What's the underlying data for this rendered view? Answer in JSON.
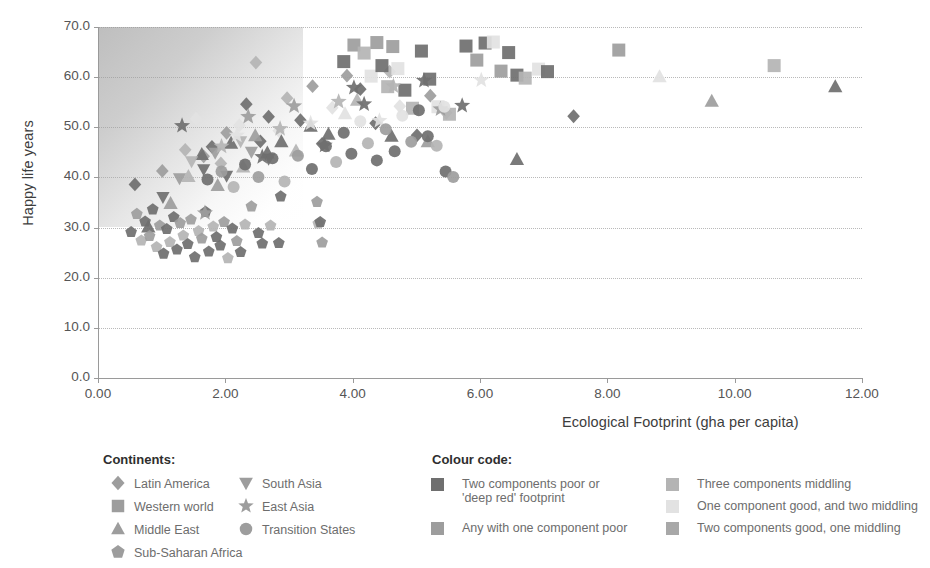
{
  "chart_data": {
    "type": "scatter",
    "title": "",
    "xlabel": "Ecological Footprint (gha per capita)",
    "ylabel": "Happy life years",
    "xlim": [
      0,
      12
    ],
    "ylim": [
      0,
      70
    ],
    "xticks": [
      "0.00",
      "2.00",
      "4.00",
      "6.00",
      "8.00",
      "10.00",
      "12.00"
    ],
    "yticks": [
      "0.0",
      "10.0",
      "20.0",
      "30.0",
      "40.0",
      "50.0",
      "60.0",
      "70.0"
    ],
    "xtick_values": [
      0,
      2,
      4,
      6,
      8,
      10,
      12
    ],
    "ytick_values": [
      0,
      10,
      20,
      30,
      40,
      50,
      60,
      70
    ],
    "grid": "horizontal-dotted",
    "legend_position": "below-plot",
    "shaded_region": "upper-left gradient (sustainable / high wellbeing zone)",
    "series": [
      {
        "name": "Latin America",
        "marker": "diamond",
        "points": [
          [
            0.58,
            38.6
          ],
          [
            1.01,
            41.3
          ],
          [
            1.37,
            45.5
          ],
          [
            1.54,
            51.7
          ],
          [
            1.66,
            44.2
          ],
          [
            1.79,
            46.1
          ],
          [
            1.93,
            42.8
          ],
          [
            2.02,
            48.9
          ],
          [
            2.22,
            50.4
          ],
          [
            2.33,
            54.6
          ],
          [
            2.48,
            62.9
          ],
          [
            2.55,
            47.2
          ],
          [
            2.68,
            52.1
          ],
          [
            2.84,
            49.3
          ],
          [
            2.97,
            55.8
          ],
          [
            3.18,
            51.4
          ],
          [
            3.37,
            58.2
          ],
          [
            3.52,
            46.7
          ],
          [
            3.68,
            53.9
          ],
          [
            3.91,
            60.3
          ],
          [
            4.12,
            57.6
          ],
          [
            4.36,
            50.8
          ],
          [
            4.58,
            61.1
          ],
          [
            4.74,
            54.2
          ],
          [
            5.01,
            48.4
          ],
          [
            5.22,
            56.3
          ],
          [
            5.47,
            52.9
          ],
          [
            7.47,
            52.2
          ]
        ]
      },
      {
        "name": "Western world",
        "marker": "square",
        "points": [
          [
            3.86,
            63.1
          ],
          [
            4.02,
            66.4
          ],
          [
            4.18,
            64.8
          ],
          [
            4.29,
            60.2
          ],
          [
            4.38,
            66.9
          ],
          [
            4.46,
            62.3
          ],
          [
            4.55,
            58.1
          ],
          [
            4.63,
            66.1
          ],
          [
            4.71,
            61.7
          ],
          [
            4.82,
            57.4
          ],
          [
            4.94,
            53.8
          ],
          [
            5.08,
            65.2
          ],
          [
            5.21,
            59.6
          ],
          [
            5.34,
            54.1
          ],
          [
            5.52,
            52.6
          ],
          [
            5.78,
            66.2
          ],
          [
            5.95,
            63.4
          ],
          [
            6.08,
            66.8
          ],
          [
            6.21,
            67.0
          ],
          [
            6.33,
            61.2
          ],
          [
            6.45,
            64.9
          ],
          [
            6.58,
            60.4
          ],
          [
            6.71,
            59.8
          ],
          [
            6.92,
            61.6
          ],
          [
            7.06,
            61.1
          ],
          [
            8.18,
            65.4
          ],
          [
            10.62,
            62.3
          ]
        ]
      },
      {
        "name": "Middle East",
        "marker": "triangle-up",
        "points": [
          [
            0.79,
            30.1
          ],
          [
            1.14,
            34.8
          ],
          [
            1.42,
            40.2
          ],
          [
            1.63,
            44.6
          ],
          [
            1.88,
            38.4
          ],
          [
            2.09,
            46.8
          ],
          [
            2.28,
            42.1
          ],
          [
            2.47,
            48.3
          ],
          [
            2.66,
            44.9
          ],
          [
            2.88,
            47.1
          ],
          [
            3.11,
            45.3
          ],
          [
            3.34,
            50.2
          ],
          [
            3.62,
            48.6
          ],
          [
            3.88,
            52.7
          ],
          [
            4.07,
            55.4
          ],
          [
            4.61,
            48.2
          ],
          [
            5.18,
            47.1
          ],
          [
            6.58,
            43.6
          ],
          [
            8.82,
            60.1
          ],
          [
            9.64,
            55.2
          ],
          [
            11.58,
            58.1
          ]
        ]
      },
      {
        "name": "Sub-Saharan Africa",
        "marker": "pentagon",
        "points": [
          [
            0.52,
            29.1
          ],
          [
            0.61,
            32.7
          ],
          [
            0.68,
            27.4
          ],
          [
            0.74,
            31.2
          ],
          [
            0.81,
            28.3
          ],
          [
            0.86,
            33.6
          ],
          [
            0.92,
            26.1
          ],
          [
            0.97,
            30.4
          ],
          [
            1.03,
            24.8
          ],
          [
            1.08,
            29.7
          ],
          [
            1.13,
            27.1
          ],
          [
            1.19,
            32.1
          ],
          [
            1.24,
            25.6
          ],
          [
            1.29,
            30.9
          ],
          [
            1.34,
            28.4
          ],
          [
            1.41,
            26.7
          ],
          [
            1.46,
            31.6
          ],
          [
            1.52,
            24.1
          ],
          [
            1.58,
            29.3
          ],
          [
            1.63,
            27.8
          ],
          [
            1.69,
            33.1
          ],
          [
            1.74,
            25.2
          ],
          [
            1.81,
            30.2
          ],
          [
            1.86,
            28.1
          ],
          [
            1.92,
            26.4
          ],
          [
            1.98,
            31.1
          ],
          [
            2.04,
            23.9
          ],
          [
            2.11,
            29.8
          ],
          [
            2.18,
            27.3
          ],
          [
            2.24,
            25.1
          ],
          [
            2.31,
            30.6
          ],
          [
            2.41,
            34.2
          ],
          [
            2.52,
            28.9
          ],
          [
            2.58,
            26.8
          ],
          [
            2.71,
            30.4
          ],
          [
            2.84,
            26.9
          ],
          [
            2.87,
            36.2
          ],
          [
            3.44,
            35.1
          ],
          [
            3.46,
            30.8
          ],
          [
            3.49,
            31.1
          ],
          [
            3.52,
            27.0
          ]
        ]
      },
      {
        "name": "South Asia",
        "marker": "triangle-down",
        "points": [
          [
            1.02,
            36.1
          ],
          [
            1.28,
            39.8
          ],
          [
            1.47,
            43.2
          ],
          [
            1.66,
            41.6
          ],
          [
            1.84,
            44.9
          ],
          [
            2.02,
            40.3
          ],
          [
            2.24,
            47.2
          ],
          [
            2.41,
            45.1
          ],
          [
            2.68,
            43.7
          ]
        ]
      },
      {
        "name": "East Asia",
        "marker": "star",
        "points": [
          [
            1.32,
            50.3
          ],
          [
            1.68,
            32.9
          ],
          [
            1.94,
            46.2
          ],
          [
            2.18,
            48.4
          ],
          [
            2.36,
            52.1
          ],
          [
            2.58,
            44.1
          ],
          [
            2.86,
            49.7
          ],
          [
            3.08,
            54.2
          ],
          [
            3.34,
            50.8
          ],
          [
            3.56,
            46.4
          ],
          [
            3.78,
            55.1
          ],
          [
            4.02,
            57.9
          ],
          [
            4.18,
            54.6
          ],
          [
            4.42,
            51.3
          ],
          [
            4.64,
            58.2
          ],
          [
            5.12,
            59.3
          ],
          [
            5.38,
            53.6
          ],
          [
            5.72,
            54.3
          ],
          [
            6.02,
            59.4
          ]
        ]
      },
      {
        "name": "Transition States",
        "marker": "circle",
        "points": [
          [
            1.72,
            39.6
          ],
          [
            1.94,
            41.2
          ],
          [
            2.13,
            38.1
          ],
          [
            2.31,
            42.6
          ],
          [
            2.52,
            40.1
          ],
          [
            2.74,
            43.8
          ],
          [
            2.93,
            39.2
          ],
          [
            3.14,
            44.3
          ],
          [
            3.36,
            41.7
          ],
          [
            3.58,
            46.2
          ],
          [
            3.74,
            43.1
          ],
          [
            3.86,
            48.9
          ],
          [
            3.98,
            44.7
          ],
          [
            4.12,
            51.2
          ],
          [
            4.24,
            46.8
          ],
          [
            4.38,
            43.4
          ],
          [
            4.52,
            49.6
          ],
          [
            4.66,
            45.2
          ],
          [
            4.78,
            52.3
          ],
          [
            4.92,
            47.1
          ],
          [
            5.04,
            53.4
          ],
          [
            5.18,
            48.2
          ],
          [
            5.32,
            46.3
          ],
          [
            5.44,
            54.1
          ],
          [
            5.46,
            41.2
          ],
          [
            5.58,
            40.1
          ]
        ]
      }
    ]
  },
  "legend": {
    "continents_heading": "Continents:",
    "colour_heading": "Colour code:",
    "continents_col1": [
      {
        "label": "Latin America",
        "marker": "diamond"
      },
      {
        "label": "Western world",
        "marker": "square"
      },
      {
        "label": "Middle East",
        "marker": "triangle-up"
      },
      {
        "label": "Sub-Saharan Africa",
        "marker": "pentagon"
      }
    ],
    "continents_col2": [
      {
        "label": "South Asia",
        "marker": "triangle-down"
      },
      {
        "label": "East Asia",
        "marker": "star"
      },
      {
        "label": "Transition States",
        "marker": "circle"
      }
    ],
    "colour_col1": [
      {
        "line1": "Two components poor or",
        "line2": "'deep red' footprint",
        "color": "#6f6f6f"
      },
      {
        "line1": "Any with one component poor",
        "line2": "",
        "color": "#9d9d9d"
      }
    ],
    "colour_col2": [
      {
        "line1": "Three components middling",
        "line2": "",
        "color": "#b4b4b4"
      },
      {
        "line1": "One component good, and two middling",
        "line2": "",
        "color": "#e2e2e2"
      },
      {
        "line1": "Two components good, one middling",
        "line2": "",
        "color": "#a8a8a8"
      }
    ]
  },
  "colors": {
    "marker_dark": "#6f6f6f",
    "marker_mid": "#9d9d9d",
    "marker_light": "#b4b4b4",
    "marker_pale": "#e2e2e2",
    "axis": "#9a9a9a",
    "grid": "#b9b9b9",
    "text": "#5a5a5a"
  }
}
